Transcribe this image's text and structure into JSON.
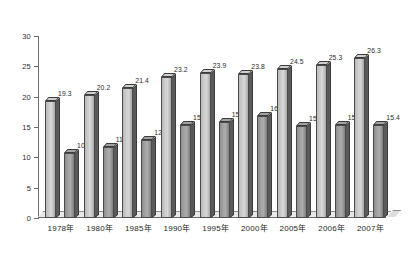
{
  "chart_data": {
    "type": "bar",
    "title": "",
    "xlabel": "",
    "ylabel": "",
    "ylim": [
      0,
      30
    ],
    "yticks": [
      0,
      5,
      10,
      15,
      20,
      25,
      30
    ],
    "grid": false,
    "legend": "none",
    "categories": [
      "1978年",
      "1980年",
      "1985年",
      "1990年",
      "1995年",
      "2000年",
      "2005年",
      "2006年",
      "2007年"
    ],
    "series": [
      {
        "name": "series-1",
        "color": "#cfcfcf",
        "values": [
          19.3,
          20.2,
          21.4,
          23.2,
          23.9,
          23.8,
          24.5,
          25.3,
          26.3
        ],
        "labels": [
          "19.3",
          "20.2",
          "21.4",
          "23.2",
          "23.9",
          "23.8",
          "24.5",
          "25.3",
          "26.3"
        ]
      },
      {
        "name": "series-2",
        "color": "#a5a5a5",
        "values": [
          10.7,
          11.7,
          12.8,
          15.4,
          15.8,
          16.8,
          15.2,
          15.4,
          15.4
        ],
        "labels": [
          "10.7",
          "11.7",
          "12.8",
          "15.4",
          "15.8",
          "16.8",
          "15.2",
          "15.4",
          "15.4"
        ]
      }
    ],
    "ytick_labels": [
      "30",
      "25",
      "20",
      "15",
      "10",
      "5",
      "0"
    ]
  }
}
